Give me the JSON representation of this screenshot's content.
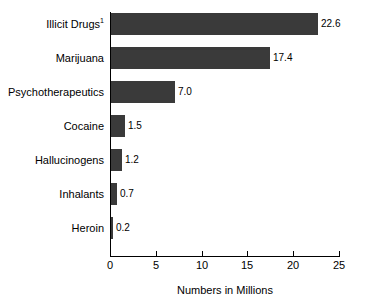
{
  "chart_data": {
    "type": "bar",
    "orientation": "horizontal",
    "title": "",
    "xlabel": "Numbers in Millions",
    "ylabel": "",
    "xlim": [
      0,
      25
    ],
    "xticks": [
      0,
      5,
      10,
      15,
      20,
      25
    ],
    "xtick_labels": [
      "0",
      "5",
      "10",
      "15",
      "20",
      "25"
    ],
    "grid": false,
    "legend": null,
    "bar_color": "#3a3a3a",
    "axis_color": "#000000",
    "categories": [
      "Illicit Drugs",
      "Marijuana",
      "Psychotherapeutics",
      "Cocaine",
      "Hallucinogens",
      "Inhalants",
      "Heroin"
    ],
    "category_footnotes": [
      "1",
      "",
      "",
      "",
      "",
      "",
      ""
    ],
    "values": [
      22.6,
      17.4,
      7.0,
      1.5,
      1.2,
      0.7,
      0.2
    ],
    "value_labels": [
      "22.6",
      "17.4",
      "7.0",
      "1.5",
      "1.2",
      "0.7",
      "0.2"
    ]
  },
  "chart": {
    "x_axis_title": "Numbers in Millions",
    "rows": [
      {
        "label": "Illicit Drugs",
        "footnote": "1",
        "value_label": "22.6"
      },
      {
        "label": "Marijuana",
        "footnote": "",
        "value_label": "17.4"
      },
      {
        "label": "Psychotherapeutics",
        "footnote": "",
        "value_label": "7.0"
      },
      {
        "label": "Cocaine",
        "footnote": "",
        "value_label": "1.5"
      },
      {
        "label": "Hallucinogens",
        "footnote": "",
        "value_label": "1.2"
      },
      {
        "label": "Inhalants",
        "footnote": "",
        "value_label": "0.7"
      },
      {
        "label": "Heroin",
        "footnote": "",
        "value_label": "0.2"
      }
    ],
    "ticks": [
      {
        "label": "0"
      },
      {
        "label": "5"
      },
      {
        "label": "10"
      },
      {
        "label": "15"
      },
      {
        "label": "20"
      },
      {
        "label": "25"
      }
    ]
  }
}
